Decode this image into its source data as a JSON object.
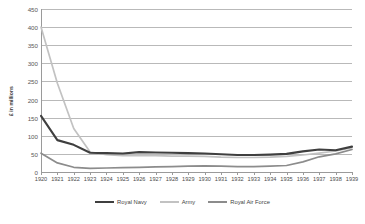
{
  "chart_data": {
    "type": "line",
    "title": "",
    "xlabel": "",
    "ylabel": "£ in millions",
    "ylim": [
      0,
      450
    ],
    "ytick_step": 50,
    "yticks": [
      450,
      400,
      350,
      300,
      250,
      200,
      150,
      100,
      50,
      0
    ],
    "grid": "horizontal",
    "legend_position": "bottom-center",
    "x": [
      1920,
      1921,
      1922,
      1923,
      1924,
      1925,
      1926,
      1927,
      1928,
      1929,
      1930,
      1931,
      1932,
      1933,
      1934,
      1935,
      1936,
      1937,
      1938,
      1939
    ],
    "categories": [
      "1920",
      "1921",
      "1922",
      "1923",
      "1924",
      "1925",
      "1926",
      "1927",
      "1928",
      "1929",
      "1930",
      "1931",
      "1932",
      "1933",
      "1934",
      "1935",
      "1936",
      "1937",
      "1938",
      "1939"
    ],
    "series": [
      {
        "name": "Royal Navy",
        "color": "#3f3f3f",
        "values": [
          155,
          88,
          75,
          53,
          52,
          51,
          55,
          54,
          53,
          52,
          51,
          49,
          47,
          47,
          48,
          50,
          57,
          62,
          60,
          70
        ]
      },
      {
        "name": "Army",
        "color": "#c2c2c2",
        "values": [
          400,
          245,
          120,
          55,
          48,
          45,
          46,
          45,
          44,
          44,
          43,
          41,
          40,
          40,
          41,
          43,
          47,
          52,
          58,
          67
        ]
      },
      {
        "name": "Royal Air Force",
        "color": "#8c8c8c",
        "values": [
          52,
          25,
          13,
          10,
          11,
          12,
          13,
          14,
          15,
          16,
          17,
          16,
          15,
          15,
          16,
          18,
          28,
          42,
          50,
          62
        ]
      }
    ]
  },
  "axis": {
    "y_title": "£ in millions"
  },
  "legend": {
    "items": [
      {
        "label": "Royal Navy"
      },
      {
        "label": "Army"
      },
      {
        "label": "Royal Air Force"
      }
    ]
  }
}
